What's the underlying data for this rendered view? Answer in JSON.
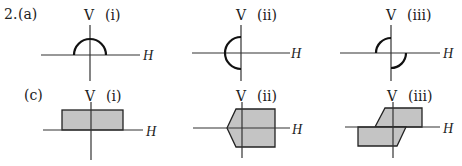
{
  "problem": {
    "number": "2.",
    "rows": [
      {
        "label": "(a)",
        "panels": [
          {
            "id": "(i)",
            "v_label": "V",
            "h_label": "H",
            "shape": "upper semicircle centered on origin"
          },
          {
            "id": "(ii)",
            "v_label": "V",
            "h_label": "H",
            "shape": "left semicircle centered on origin"
          },
          {
            "id": "(iii)",
            "v_label": "V",
            "h_label": "H",
            "shape": "quarter circles in 2nd and 4th quadrants"
          }
        ]
      },
      {
        "label": "(c)",
        "panels": [
          {
            "id": "(i)",
            "v_label": "V",
            "h_label": "H",
            "shape": "shaded rectangle above H axis"
          },
          {
            "id": "(ii)",
            "v_label": "V",
            "h_label": "H",
            "shape": "shaded pentagon symmetric about H axis, pointed on left"
          },
          {
            "id": "(iii)",
            "v_label": "V",
            "h_label": "H",
            "shape": "two shaded parallelograms, upper right and lower left"
          }
        ]
      }
    ]
  },
  "colors": {
    "fill": "#c4c4c4",
    "stroke": "#222222"
  }
}
